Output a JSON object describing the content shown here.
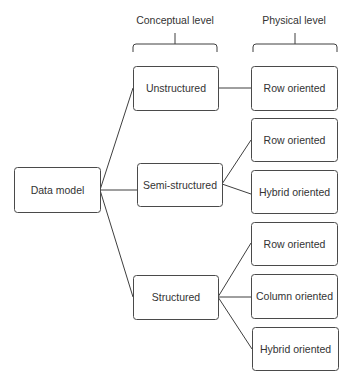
{
  "diagram": {
    "title_cutoff": "",
    "columns": [
      {
        "id": "conceptual",
        "label": "Conceptual level",
        "label_x": 175,
        "label_y": 24,
        "brace": {
          "x1": 133,
          "x2": 217,
          "y": 44,
          "tip_y": 33,
          "drop": 8
        }
      },
      {
        "id": "physical",
        "label": "Physical level",
        "label_x": 294,
        "label_y": 24,
        "brace": {
          "x1": 253,
          "x2": 337,
          "y": 44,
          "tip_y": 33,
          "drop": 8
        }
      }
    ],
    "nodes": [
      {
        "id": "data-model",
        "label": "Data model",
        "x": 14,
        "y": 167,
        "w": 86,
        "h": 45,
        "level": "root"
      },
      {
        "id": "unstructured",
        "label": "Unstructured",
        "x": 133,
        "y": 66,
        "w": 85,
        "h": 44,
        "level": "conceptual"
      },
      {
        "id": "semi-structured",
        "label": "Semi-structured",
        "x": 137,
        "y": 163,
        "w": 85,
        "h": 43,
        "level": "conceptual"
      },
      {
        "id": "structured",
        "label": "Structured",
        "x": 133,
        "y": 275,
        "w": 85,
        "h": 44,
        "level": "conceptual"
      },
      {
        "id": "unstructured-row",
        "label": "Row oriented",
        "x": 251,
        "y": 66,
        "w": 86,
        "h": 44,
        "level": "physical"
      },
      {
        "id": "semi-row",
        "label": "Row oriented",
        "x": 251,
        "y": 118,
        "w": 86,
        "h": 43,
        "level": "physical"
      },
      {
        "id": "semi-hybrid",
        "label": "Hybrid oriented",
        "x": 251,
        "y": 170,
        "w": 86,
        "h": 43,
        "level": "physical"
      },
      {
        "id": "structured-row",
        "label": "Row oriented",
        "x": 251,
        "y": 222,
        "w": 86,
        "h": 43,
        "level": "physical"
      },
      {
        "id": "structured-column",
        "label": "Column oriented",
        "x": 251,
        "y": 274,
        "w": 86,
        "h": 44,
        "level": "physical"
      },
      {
        "id": "structured-hybrid",
        "label": "Hybrid oriented",
        "x": 252,
        "y": 327,
        "w": 86,
        "h": 43,
        "level": "physical"
      }
    ],
    "edges": [
      {
        "from": "data-model",
        "to": "unstructured",
        "x1": 100,
        "y1": 190,
        "x2": 133,
        "y2": 88
      },
      {
        "from": "data-model",
        "to": "semi-structured",
        "x1": 100,
        "y1": 190,
        "x2": 137,
        "y2": 190
      },
      {
        "from": "data-model",
        "to": "structured",
        "x1": 100,
        "y1": 190,
        "x2": 133,
        "y2": 297
      },
      {
        "from": "unstructured",
        "to": "unstructured-row",
        "x1": 218,
        "y1": 88,
        "x2": 251,
        "y2": 88
      },
      {
        "from": "semi-structured",
        "to": "semi-row",
        "x1": 222,
        "y1": 184,
        "x2": 251,
        "y2": 140
      },
      {
        "from": "semi-structured",
        "to": "semi-hybrid",
        "x1": 222,
        "y1": 184,
        "x2": 251,
        "y2": 194
      },
      {
        "from": "structured",
        "to": "structured-row",
        "x1": 218,
        "y1": 297,
        "x2": 251,
        "y2": 243
      },
      {
        "from": "structured",
        "to": "structured-column",
        "x1": 218,
        "y1": 297,
        "x2": 251,
        "y2": 297
      },
      {
        "from": "structured",
        "to": "structured-hybrid",
        "x1": 218,
        "y1": 297,
        "x2": 252,
        "y2": 349
      }
    ],
    "style": {
      "stroke": "#3f3f3f",
      "text": "#333333",
      "background": "#ffffff",
      "font_size": 10.5,
      "corner_radius": 3
    }
  }
}
